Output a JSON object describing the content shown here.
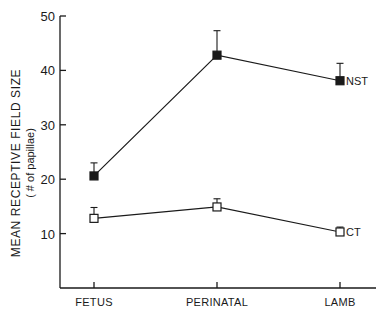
{
  "chart_data": {
    "type": "line",
    "title": "",
    "xlabel": "",
    "ylabel": "MEAN RECEPTIVE FIELD SIZE",
    "ylabel_sub": "( # of papillae)",
    "categories": [
      "FETUS",
      "PERINATAL",
      "LAMB"
    ],
    "ylim": [
      0,
      50
    ],
    "yticks": [
      10,
      20,
      30,
      40,
      50
    ],
    "grid": false,
    "legend": "inline labels at right end of each series",
    "series": [
      {
        "name": "NST",
        "marker": "filled-square",
        "values": [
          20.6,
          42.8,
          38.1
        ],
        "error_upper": [
          23.0,
          47.3,
          41.3
        ]
      },
      {
        "name": "CT",
        "marker": "open-square",
        "values": [
          12.8,
          14.9,
          10.3
        ],
        "error_upper": [
          14.8,
          16.4,
          11.2
        ]
      }
    ]
  },
  "colors": {
    "ink": "#1a1a1a",
    "background": "#ffffff"
  }
}
